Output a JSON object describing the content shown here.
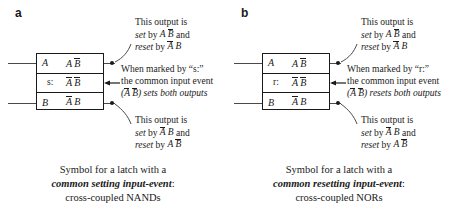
{
  "panels": [
    {
      "label": "a",
      "mark": "s:",
      "pins": {
        "a": "A",
        "b": "B"
      },
      "rows": {
        "top": {
          "t1": "A",
          "t1_bar": false,
          "t2": "B",
          "t2_bar": true
        },
        "middle": {
          "t1": "A",
          "t1_bar": true,
          "t2": "B",
          "t2_bar": true
        },
        "bottom": {
          "t1": "A",
          "t1_bar": true,
          "t2": "B",
          "t2_bar": false
        }
      },
      "annotation_top": {
        "line1": "This output is",
        "set_word": "set",
        "by_word": "by",
        "set_expr": {
          "t1": "A",
          "t1_bar": false,
          "t2": "B",
          "t2_bar": true
        },
        "and_word": "and",
        "reset_word": "reset",
        "reset_expr": {
          "t1": "A",
          "t1_bar": true,
          "t2": "B",
          "t2_bar": false
        }
      },
      "annotation_middle": {
        "line1": "When marked by “s:”",
        "line2": "the common input event",
        "line3_open": "(",
        "line3_expr": {
          "t1": "A",
          "t1_bar": true,
          "t2": "B",
          "t2_bar": true
        },
        "line3_close": ")",
        "line3_tail": "sets both outputs"
      },
      "annotation_bottom": {
        "line1": "This output is",
        "set_word": "set",
        "by_word": "by",
        "set_expr": {
          "t1": "A",
          "t1_bar": true,
          "t2": "B",
          "t2_bar": false
        },
        "and_word": "and",
        "reset_word": "reset",
        "reset_expr": {
          "t1": "A",
          "t1_bar": false,
          "t2": "B",
          "t2_bar": true
        }
      },
      "caption": {
        "line1": "Symbol for a latch with a",
        "emphasis": "common setting input-event",
        "colon": ":",
        "line3": "cross-coupled NANDs"
      }
    },
    {
      "label": "b",
      "mark": "r:",
      "pins": {
        "a": "A",
        "b": "B"
      },
      "rows": {
        "top": {
          "t1": "A",
          "t1_bar": false,
          "t2": "B",
          "t2_bar": true
        },
        "middle": {
          "t1": "A",
          "t1_bar": true,
          "t2": "B",
          "t2_bar": true
        },
        "bottom": {
          "t1": "A",
          "t1_bar": true,
          "t2": "B",
          "t2_bar": false
        }
      },
      "annotation_top": {
        "line1": "This output is",
        "set_word": "set",
        "by_word": "by",
        "set_expr": {
          "t1": "A",
          "t1_bar": false,
          "t2": "B",
          "t2_bar": true
        },
        "and_word": "and",
        "reset_word": "reset",
        "reset_expr": {
          "t1": "A",
          "t1_bar": true,
          "t2": "B",
          "t2_bar": false
        }
      },
      "annotation_middle": {
        "line1": "When marked by “r:”",
        "line2": "the common input event",
        "line3_open": "(",
        "line3_expr": {
          "t1": "A",
          "t1_bar": true,
          "t2": "B",
          "t2_bar": true
        },
        "line3_close": ")",
        "line3_tail": "resets both outputs"
      },
      "annotation_bottom": {
        "line1": "This output is",
        "set_word": "set",
        "by_word": "by",
        "set_expr": {
          "t1": "A",
          "t1_bar": true,
          "t2": "B",
          "t2_bar": false
        },
        "and_word": "and",
        "reset_word": "reset",
        "reset_expr": {
          "t1": "A",
          "t1_bar": false,
          "t2": "B",
          "t2_bar": true
        }
      },
      "caption": {
        "line1": "Symbol for a latch with a",
        "emphasis": "common resetting input-event",
        "colon": ":",
        "line3": "cross-coupled NORs"
      }
    }
  ],
  "colors": {
    "ink": "#1a1a1a",
    "wire": "#4a4a4a",
    "background": "#ffffff"
  }
}
